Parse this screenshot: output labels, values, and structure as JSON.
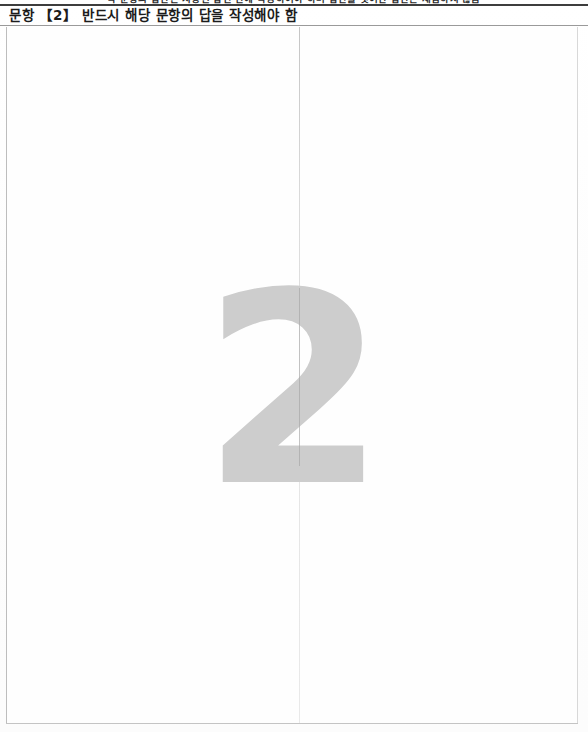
{
  "document": {
    "type": "scanned-answer-sheet",
    "clipped_top_line": "각 문항의 답안은 지정된 답란 안에 작성하여야 하며 답란을 벗어난 답안은 채점하지 않음",
    "question_number": "2",
    "header_text": "문항 【2】 반드시 해당 문항의 답을 작성해야 함",
    "answer_area_content": "",
    "watermark_number": "2"
  },
  "colors": {
    "page_background": "#fdfdfd",
    "top_rule": "#3d3d3d",
    "header_rule": "#9a9a9a",
    "box_border": "#bdbdbd",
    "header_text": "#1c1c1c",
    "watermark": "#cdcdcd",
    "fold_line": "#9a9a9a"
  }
}
